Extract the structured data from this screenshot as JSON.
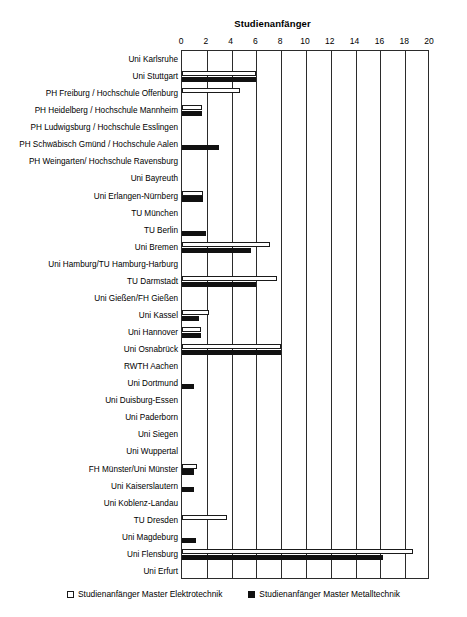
{
  "chart_data": {
    "type": "bar",
    "orientation": "horizontal",
    "title": "Studienanfänger",
    "xlabel": "",
    "ylabel": "",
    "xlim": [
      0,
      20
    ],
    "xticks": [
      0,
      2,
      4,
      6,
      8,
      10,
      12,
      14,
      16,
      18,
      20
    ],
    "grid": true,
    "legend_position": "bottom",
    "categories": [
      "Uni Karlsruhe",
      "Uni Stuttgart",
      "PH Freiburg / Hochschule Offenburg",
      "PH Heidelberg / Hochschule Mannheim",
      "PH Ludwigsburg / Hochschule Esslingen",
      "PH Schwäbisch Gmünd / Hochschule Aalen",
      "PH Weingarten/ Hochschule Ravensburg",
      "Uni Bayreuth",
      "Uni Erlangen-Nürnberg",
      "TU München",
      "TU Berlin",
      "Uni Bremen",
      "Uni Hamburg/TU Hamburg-Harburg",
      "TU Darmstadt",
      "Uni Gießen/FH Gießen",
      "Uni Kassel",
      "Uni Hannover",
      "Uni Osnabrück",
      "RWTH Aachen",
      "Uni Dortmund",
      "Uni Duisburg-Essen",
      "Uni Paderborn",
      "Uni Siegen",
      "Uni Wuppertal",
      "FH Münster/Uni Münster",
      "Uni Kaiserslautern",
      "Uni Koblenz-Landau",
      "TU Dresden",
      "Uni Magdeburg",
      "Uni Flensburg",
      "Uni Erfurt"
    ],
    "series": [
      {
        "name": "Studienanfänger Master Elektrotechnik",
        "color": "#ffffff",
        "values": [
          0,
          6,
          4.7,
          1.6,
          0,
          0,
          0,
          0,
          1.7,
          0,
          0,
          7.1,
          0,
          7.7,
          0,
          2.2,
          1.5,
          8,
          0,
          0,
          0,
          0,
          0,
          0,
          1.2,
          0,
          0,
          3.6,
          0,
          18.6,
          0
        ]
      },
      {
        "name": "Studienanfänger Master Metalltechnik",
        "color": "#111111",
        "values": [
          0,
          6,
          0,
          1.6,
          0,
          3,
          0,
          0,
          1.7,
          0,
          1.9,
          5.6,
          0,
          6,
          0,
          1.4,
          1.5,
          8,
          0,
          1,
          0,
          0,
          0,
          0,
          1,
          1,
          0,
          0,
          1.1,
          16.2,
          0
        ]
      }
    ]
  },
  "legend": [
    {
      "label": "Studienanfänger Master Elektrotechnik"
    },
    {
      "label": "Studienanfänger Master Metalltechnik"
    }
  ]
}
